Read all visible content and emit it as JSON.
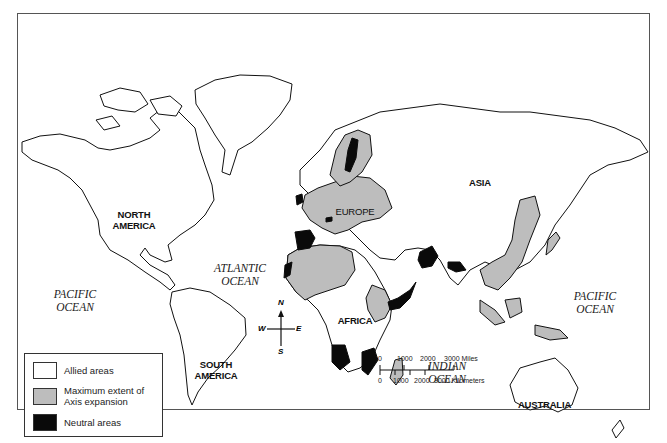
{
  "map": {
    "title": "World map: Allied areas, Axis expansion, and Neutral areas",
    "continents": [
      {
        "id": "north-america",
        "label": "NORTH\nAMERICA"
      },
      {
        "id": "south-america",
        "label": "SOUTH\nAMERICA"
      },
      {
        "id": "europe",
        "label": "EUROPE"
      },
      {
        "id": "africa",
        "label": "AFRICA"
      },
      {
        "id": "asia",
        "label": "ASIA"
      },
      {
        "id": "australia",
        "label": "AUSTRALIA"
      }
    ],
    "oceans": [
      {
        "id": "pacific-west",
        "line1": "PACIFIC",
        "line2": "OCEAN"
      },
      {
        "id": "atlantic",
        "line1": "ATLANTIC",
        "line2": "OCEAN"
      },
      {
        "id": "indian",
        "line1": "INDIAN",
        "line2": "OCEAN"
      },
      {
        "id": "pacific-east",
        "line1": "PACIFIC",
        "line2": "OCEAN"
      }
    ],
    "colors": {
      "allied": "#ffffff",
      "axis": "#bdbdbd",
      "neutral": "#0a0a0a",
      "outline": "#111111"
    }
  },
  "legend": {
    "items": [
      {
        "label": "Allied areas",
        "color": "#ffffff"
      },
      {
        "label_line1": "Maximum extent of",
        "label_line2": "Axis expansion",
        "color": "#bdbdbd"
      },
      {
        "label": "Neutral areas",
        "color": "#0a0a0a"
      }
    ]
  },
  "compass": {
    "n": "N",
    "s": "S",
    "e": "E",
    "w": "W"
  },
  "scale": {
    "miles_ticks": [
      "0",
      "1000",
      "2000",
      "3000 Miles"
    ],
    "km_ticks": [
      "0",
      "1000",
      "2000",
      "3000 Kilometers"
    ]
  }
}
